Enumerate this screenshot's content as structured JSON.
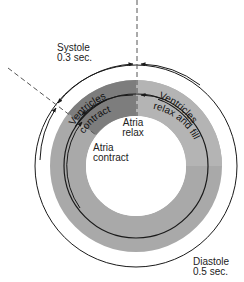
{
  "phases": {
    "systole": {
      "label": "Systole",
      "duration": "0.3 sec."
    },
    "diastole": {
      "label": "Diastole",
      "duration": "0.5 sec."
    }
  },
  "ring_labels": {
    "ventricles_contract": [
      "Ventricles",
      "contract"
    ],
    "ventricles_relax": [
      "Ventricles",
      "relax and fill"
    ]
  },
  "inner_labels": {
    "atria_relax": [
      "Atria",
      "relax"
    ],
    "atria_contract": [
      "Atria",
      "contract"
    ]
  },
  "colors": {
    "ring_gray": "#a9a9a9",
    "ring_dark": "#7d7d7d",
    "line": "#1a1a1a",
    "background": "#ffffff"
  }
}
